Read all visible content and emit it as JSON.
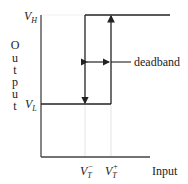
{
  "diagram": {
    "type": "hysteresis-transfer-characteristic",
    "y_axis_label": [
      "O",
      "u",
      "t",
      "p",
      "u",
      "t"
    ],
    "x_axis_label": "Input",
    "levels": {
      "high": {
        "main": "V",
        "sub": "H"
      },
      "low": {
        "main": "V",
        "sub": "L"
      }
    },
    "thresholds": {
      "lower": {
        "main": "V",
        "sub": "T",
        "sup": "−"
      },
      "upper": {
        "main": "V",
        "sub": "T",
        "sup": "+"
      }
    },
    "annotation": "deadband",
    "colors": {
      "line": "#222222",
      "grid": "#dddddd",
      "background": "#ffffff"
    }
  }
}
